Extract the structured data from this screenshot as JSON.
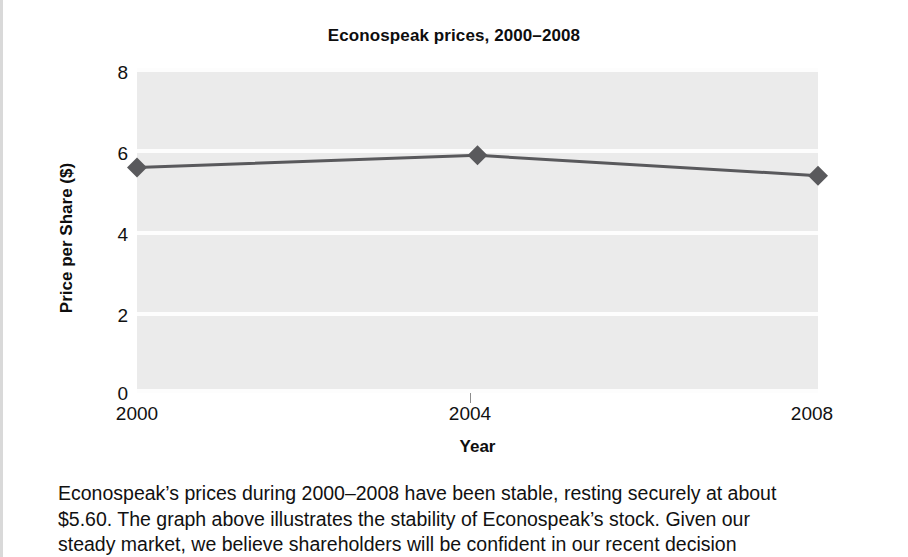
{
  "chart_data": {
    "type": "line",
    "title": "Econospeak prices, 2000–2008",
    "xlabel": "Year",
    "ylabel": "Price per Share ($)",
    "x": [
      2000,
      2004,
      2008
    ],
    "xtick_labels": [
      "2000",
      "2004",
      "2008"
    ],
    "values": [
      5.55,
      5.85,
      5.35
    ],
    "series": [
      {
        "name": "Price per Share ($)",
        "values": [
          5.55,
          5.85,
          5.35
        ],
        "color": "#59595c",
        "marker": "diamond"
      }
    ],
    "ylim": [
      0,
      8
    ],
    "xlim": [
      2000,
      2008
    ],
    "ytick_labels": [
      "0",
      "2",
      "4",
      "6",
      "8"
    ],
    "ytick_values": [
      0,
      2,
      4,
      6,
      8
    ],
    "grid": "horizontal-white-on-gray",
    "legend": "none",
    "plot_background": "#ebebeb",
    "gridline_color": "#fdfdfd"
  },
  "caption": {
    "line1": "Econospeak’s prices during 2000–2008 have been stable, resting securely at about",
    "line2": "$5.60. The graph above illustrates the stability of Econospeak’s stock. Given our",
    "line3": "steady market, we believe shareholders will be confident in our recent decision"
  }
}
